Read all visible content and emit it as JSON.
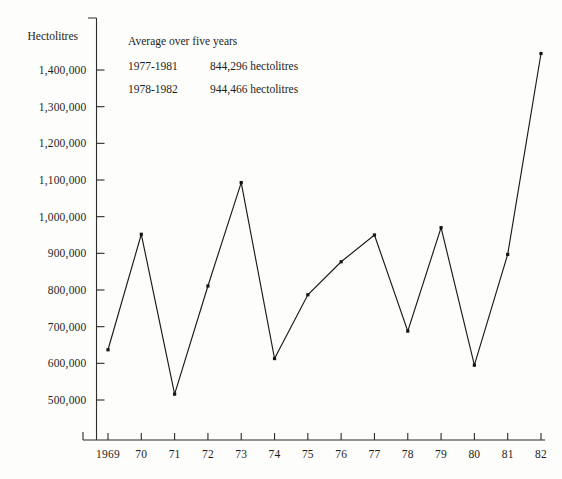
{
  "chart_data": {
    "type": "line",
    "title": "",
    "xlabel": "",
    "ylabel": "Hectolitres",
    "categories": [
      "1969",
      "70",
      "71",
      "72",
      "73",
      "74",
      "75",
      "76",
      "77",
      "78",
      "79",
      "80",
      "81",
      "82"
    ],
    "x_values": [
      1969,
      1970,
      1971,
      1972,
      1973,
      1974,
      1975,
      1976,
      1977,
      1978,
      1979,
      1980,
      1981,
      1982
    ],
    "values": [
      637000,
      952000,
      516000,
      811000,
      1093000,
      613000,
      787000,
      877000,
      950000,
      688000,
      970000,
      595000,
      897000,
      1445000
    ],
    "ylim": [
      430000,
      1480000
    ],
    "y_ticks": [
      500000,
      600000,
      700000,
      800000,
      900000,
      1000000,
      1100000,
      1200000,
      1300000,
      1400000
    ],
    "y_tick_labels": [
      "500,000",
      "600,000",
      "700,000",
      "800,000",
      "900,000",
      "1,000,000",
      "1,100,000",
      "1,200,000",
      "1,300,000",
      "1,400,000"
    ],
    "grid": false,
    "legend_position": "none",
    "markers": true,
    "line_color": "#1a1a1a",
    "background_color": "#fdfdfb"
  },
  "axis": {
    "y_title": "Hectolitres"
  },
  "annotation": {
    "heading": "Average over five years",
    "rows": [
      {
        "period": "1977-1981",
        "value": "844,296 hectolitres"
      },
      {
        "period": "1978-1982",
        "value": "944,466 hectolitres"
      }
    ]
  }
}
